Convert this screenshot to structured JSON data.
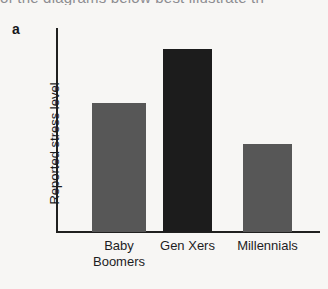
{
  "page": {
    "clipped_header_text": "of the diagrams below best illustrate th",
    "panel_letter": "a",
    "background_color": "#f7f6f4",
    "axis_color": "#20201f"
  },
  "chart_data": {
    "type": "bar",
    "title": "",
    "xlabel": "",
    "ylabel": "Reported stress level",
    "categories": [
      "Baby\nBoomers",
      "Gen Xers",
      "Millennials"
    ],
    "category_names": [
      "Baby Boomers",
      "Gen Xers",
      "Millennials"
    ],
    "values": [
      129,
      183,
      88
    ],
    "values_relative": [
      0.7,
      1.0,
      0.48
    ],
    "ylim": [
      0,
      204
    ],
    "grid": false,
    "legend": "none",
    "axis_ticks": "none",
    "bar_colors": [
      "#575757",
      "#1c1c1c",
      "#575757"
    ],
    "bars": [
      {
        "label": "Baby Boomers",
        "label_lines": "Baby\nBoomers",
        "value": 129,
        "color": "#575757",
        "left": 92,
        "width": 54,
        "top": 103
      },
      {
        "label": "Gen Xers",
        "label_lines": "Gen Xers",
        "value": 183,
        "color": "#1c1c1c",
        "left": 163,
        "width": 49,
        "top": 49
      },
      {
        "label": "Millennials",
        "label_lines": "Millennials",
        "value": 88,
        "color": "#575757",
        "left": 243,
        "width": 49,
        "top": 144
      }
    ]
  }
}
